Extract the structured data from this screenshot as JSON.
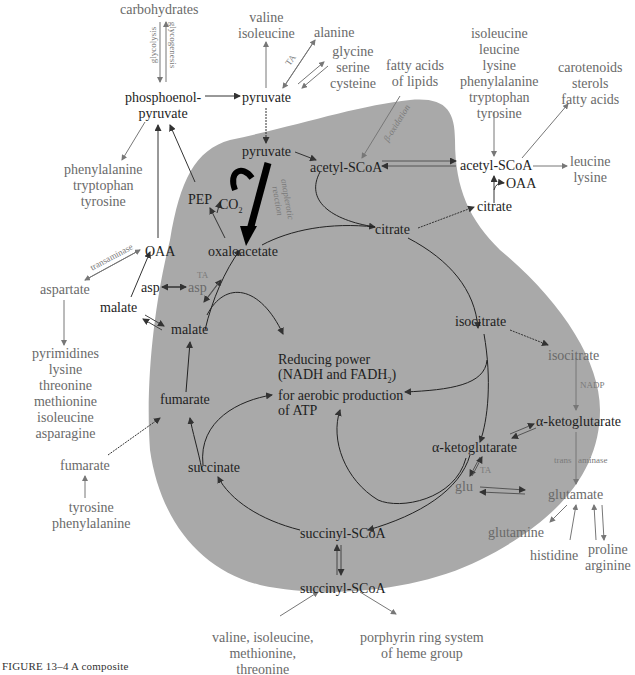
{
  "figure": {
    "caption": "FIGURE 13–4  A composite",
    "blob_color": "#a9a9a9",
    "ink_color": "#222222",
    "external_text_color": "#6a6a6a"
  },
  "top": {
    "carbohydrates": "carbohydrates",
    "glycolysis": "glycolysis",
    "glycogenesis": "glycogenesis",
    "pep_outer": "phosphoenol-\npyruvate",
    "pyruvate_outer": "pyruvate",
    "valine_isoleucine": "valine\nisoleucine",
    "alanine": "alanine",
    "ta_alanine": "TA",
    "glycine_serine_cysteine": "glycine\nserine\ncysteine",
    "fatty_acids_lipids": "fatty acids\nof lipids",
    "beta_oxidation": "β-oxidation",
    "aa_to_acetyl": "isoleucine\nleucine\nlysine\nphenylalanine\ntryptophan\ntyrosine",
    "carotenoids": "carotenoids\nsterols\nfatty acids",
    "acetyl_outer": "acetyl-SCoA",
    "leucine_lysine": "leucine\nlysine",
    "oaa_right": "OAA",
    "citrate_outer": "citrate"
  },
  "left": {
    "aromatic_out": "phenylalanine\ntryptophan\ntyrosine",
    "oaa_left": "OAA",
    "transaminase": "transaminase",
    "aspartate": "aspartate",
    "asp_outer": "asp",
    "malate_outer": "malate",
    "aspartate_products": "pyrimidines\nlysine\nthreonine\nmethionine\nisoleucine\nasparagine",
    "fumarate_outer": "fumarate",
    "tyr_phe": "tyrosine\nphenylalanine"
  },
  "cycle": {
    "pyruvate": "pyruvate",
    "acetyl_scoa": "acetyl-SCoA",
    "pep": "PEP",
    "co2": "CO",
    "co2_sub": "2",
    "anaplerotic": "anaplerotic\nreaction",
    "oxaloacetate": "oxaloacetate",
    "citrate": "citrate",
    "ta_asp": "TA",
    "asp": "asp",
    "malate": "malate",
    "isocitrate": "isocitrate",
    "reducing_power_line1": "Reducing power",
    "reducing_power_line2": "(NADH and FADH",
    "reducing_power_sub": "2",
    "reducing_power_line2_end": ")",
    "reducing_power_line3": "for aerobic production",
    "reducing_power_line4": "of ATP",
    "fumarate": "fumarate",
    "alpha_kg": "α-ketoglutarate",
    "ta_glu": "TA",
    "glu": "glu",
    "succinate": "succinate",
    "succinyl_scoa": "succinyl-SCoA"
  },
  "right": {
    "isocitrate_outer": "isocitrate",
    "nadp": "NADP",
    "alpha_kg_outer": "α-ketoglutarate",
    "trans": "trans",
    "aminase": "aminase",
    "glutamate": "glutamate",
    "glutamine": "glutamine",
    "histidine": "histidine",
    "proline_arginine": "proline\narginine"
  },
  "bottom": {
    "succinyl_outer": "succinyl-SCoA",
    "val_ile_met_thr": "valine, isoleucine,\nmethionine,\nthreonine",
    "porphyrin": "porphyrin ring system\nof heme group"
  }
}
